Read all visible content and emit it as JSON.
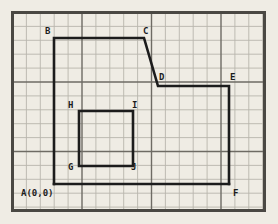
{
  "figure": {
    "background_color": "#efece4",
    "grid": {
      "cell_size": 13.9,
      "minor_line_color": "#b8b5ad",
      "major_line_color": "#6e6b64",
      "major_every": 5,
      "columns": 18,
      "rows": 14,
      "visible": true
    },
    "border": {
      "color": "#4a4843",
      "width": 3,
      "x": 11,
      "y": 11,
      "w": 255,
      "h": 201
    },
    "shape": {
      "stroke_color": "#1c1c1c",
      "stroke_width": 2.6,
      "closed": true,
      "path_points": [
        {
          "label": "A",
          "x": 54,
          "y": 184
        },
        {
          "label": "B",
          "x": 54,
          "y": 38
        },
        {
          "label": "C",
          "x": 144,
          "y": 38
        },
        {
          "label": "D",
          "x": 158,
          "y": 86
        },
        {
          "label": "E",
          "x": 229,
          "y": 86
        },
        {
          "label": "F",
          "x": 229,
          "y": 184
        }
      ]
    },
    "inner_shape": {
      "stroke_color": "#1c1c1c",
      "stroke_width": 2.6,
      "closed": true,
      "path_points": [
        {
          "label": "H",
          "x": 79,
          "y": 111
        },
        {
          "label": "I",
          "x": 133,
          "y": 111
        },
        {
          "label": "J",
          "x": 133,
          "y": 166
        },
        {
          "label": "G",
          "x": 79,
          "y": 166
        }
      ]
    },
    "labels": [
      {
        "name": "label-B",
        "text": "B",
        "x": 45,
        "y": 34
      },
      {
        "name": "label-C",
        "text": "C",
        "x": 143,
        "y": 34
      },
      {
        "name": "label-D",
        "text": "D",
        "x": 159,
        "y": 80
      },
      {
        "name": "label-E",
        "text": "E",
        "x": 230,
        "y": 80
      },
      {
        "name": "label-F",
        "text": "F",
        "x": 233,
        "y": 196
      },
      {
        "name": "label-H",
        "text": "H",
        "x": 68,
        "y": 108
      },
      {
        "name": "label-I",
        "text": "I",
        "x": 132,
        "y": 108
      },
      {
        "name": "label-G",
        "text": "G",
        "x": 68,
        "y": 170
      },
      {
        "name": "label-J",
        "text": "J",
        "x": 131,
        "y": 170
      },
      {
        "name": "label-A-origin",
        "text": "A(0,0)",
        "x": 21,
        "y": 196
      }
    ]
  }
}
